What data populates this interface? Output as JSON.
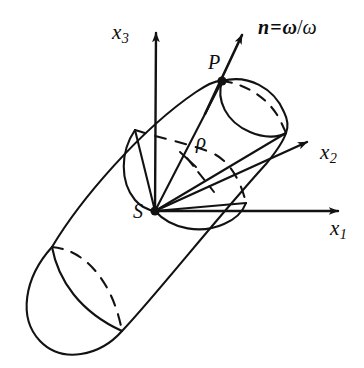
{
  "figure": {
    "kind": "geometry-diagram",
    "stroke_color": "#121212",
    "background_color": "#ffffff"
  },
  "labels": {
    "axis_x1": {
      "base": "x",
      "sub": "1"
    },
    "axis_x2": {
      "base": "x",
      "sub": "2"
    },
    "axis_x3": {
      "base": "x",
      "sub": "3"
    },
    "origin": "S",
    "point_p": "P",
    "rho": "ρ",
    "normal_vector": {
      "symbol": "n",
      "equals": "=",
      "omega_bold": "ω",
      "slash": "/",
      "omega_italic": "ω",
      "full_text": "n = ω/ω"
    }
  },
  "geometry": {
    "origin_point": {
      "x": 155,
      "y": 211
    },
    "point_p": {
      "x": 222,
      "y": 81
    },
    "axis_x1_tip": {
      "x": 346,
      "y": 211
    },
    "axis_x2_tip": {
      "x": 314,
      "y": 138
    },
    "axis_x3_tip": {
      "x": 156,
      "y": 26
    },
    "normal_arrow_tip": {
      "x": 249,
      "y": 28
    }
  }
}
